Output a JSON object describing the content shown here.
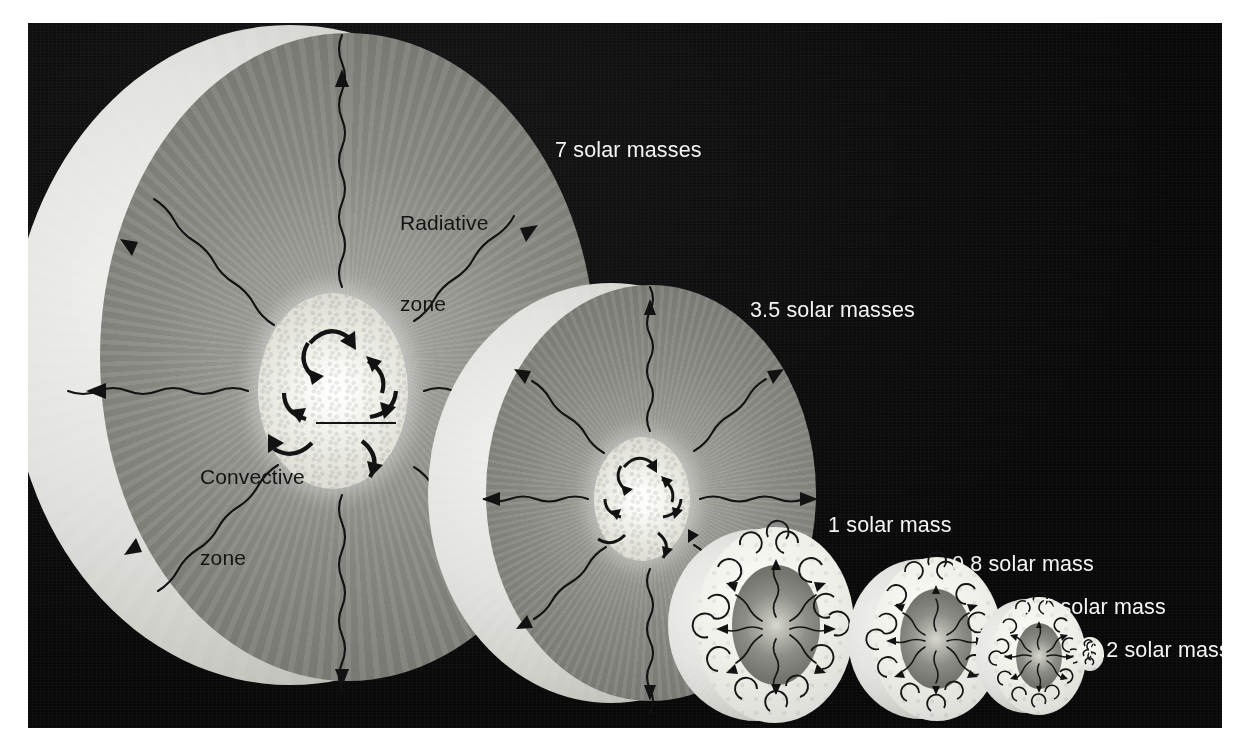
{
  "figure": {
    "background_color": "#0a0a0a",
    "page_color": "#ffffff"
  },
  "annotations": {
    "radiative_zone": {
      "line1": "Radiative",
      "line2": "zone"
    },
    "convective_zone": {
      "line1": "Convective",
      "line2": "zone"
    }
  },
  "colors": {
    "radiative_gray": "#85857f",
    "convective_white": "#f0f0ea",
    "shell_light": "#dcdcd6",
    "arrow_black": "#121212",
    "label_light": "#f4f4f2",
    "label_dark": "#141414"
  },
  "stars": [
    {
      "id": "star-7",
      "label": "7 solar masses",
      "mass": 7,
      "structure": "convective-core",
      "core_type": "convective",
      "envelope_type": "radiative",
      "has_cutaway_shell": true
    },
    {
      "id": "star-3p5",
      "label": "3.5 solar masses",
      "mass": 3.5,
      "structure": "convective-core",
      "core_type": "convective",
      "envelope_type": "radiative",
      "has_cutaway_shell": true
    },
    {
      "id": "star-1",
      "label": "1 solar mass",
      "mass": 1,
      "structure": "radiative-core",
      "core_type": "radiative",
      "envelope_type": "convective",
      "has_cutaway_shell": true
    },
    {
      "id": "star-0p8",
      "label": "0.8 solar mass",
      "mass": 0.8,
      "structure": "radiative-core",
      "core_type": "radiative",
      "envelope_type": "convective",
      "has_cutaway_shell": true
    },
    {
      "id": "star-0p5",
      "label": "0.5 solar mass",
      "mass": 0.5,
      "structure": "radiative-core",
      "core_type": "radiative",
      "envelope_type": "convective",
      "has_cutaway_shell": true
    },
    {
      "id": "star-0p2",
      "label": "0.2 solar mass",
      "mass": 0.2,
      "structure": "fully-convective",
      "core_type": "convective",
      "envelope_type": "convective",
      "has_cutaway_shell": false
    }
  ]
}
